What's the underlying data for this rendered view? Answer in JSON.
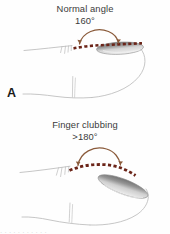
{
  "figure": {
    "width": 170,
    "height": 234,
    "background": "#fefefe",
    "bottom_cropped_text": ". .    .  .        .   .  . . .     .   ."
  },
  "colors": {
    "caption_text": "#3b3b3b",
    "panel_letter": "#1a1a1a",
    "dotted_angle_line": "#6b2418",
    "angle_arc": "#8a5a3a",
    "skin_outline": "#b9b9b9",
    "nail_dark": "#5d5d5d",
    "nail_light": "#e8e8e8",
    "nail_outline": "#8b8b8b"
  },
  "panels": [
    {
      "id": "a",
      "letter": "A",
      "caption_line1": "Normal angle",
      "caption_line2": "160°",
      "angle_value": "160°",
      "condition": "Normal angle",
      "nail_bed_angle_degrees": 160,
      "description": "Side view of a normal finger tip showing the nail and nail bed meeting at approximately 160 degrees, marked by a dotted profile line and a brown arc."
    },
    {
      "id": "b",
      "letter": "B",
      "caption_line1": "Finger clubbing",
      "caption_line2": ">180°",
      "angle_value": ">180°",
      "condition": "Finger clubbing",
      "nail_bed_angle_degrees": 180,
      "description": "Side view of a clubbed finger tip showing a bulbous, convex nail bed where the angle exceeds 180 degrees, marked by a dotted profile line and a brown arc."
    }
  ]
}
